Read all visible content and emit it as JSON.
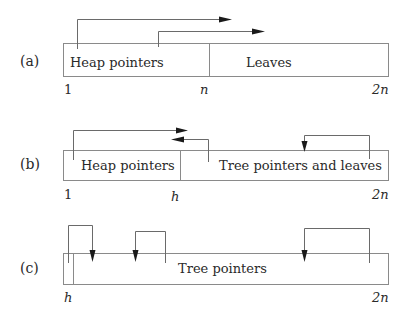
{
  "diagram": {
    "panels": [
      {
        "id": "a",
        "label": "(a)",
        "segments": [
          {
            "text": "Heap pointers"
          },
          {
            "text": "Leaves"
          }
        ],
        "ticks": [
          "1",
          "n",
          "2n"
        ],
        "arrows": [
          {
            "from": "heap pointers region",
            "to": "leaves region",
            "direction": "right"
          },
          {
            "from": "heap pointers region",
            "to": "leaves region",
            "direction": "right"
          }
        ]
      },
      {
        "id": "b",
        "label": "(b)",
        "segments": [
          {
            "text": "Heap pointers"
          },
          {
            "text": "Tree pointers and leaves"
          }
        ],
        "ticks": [
          "1",
          "h",
          "2n"
        ],
        "arrows": [
          {
            "from": "heap pointers region",
            "to": "boundary h",
            "direction": "right"
          },
          {
            "from": "tree pointers region",
            "to": "boundary h",
            "direction": "left"
          },
          {
            "from": "tree pointers region (right)",
            "to": "tree pointers region (middle)",
            "direction": "down"
          }
        ]
      },
      {
        "id": "c",
        "label": "(c)",
        "segments": [
          {
            "text": "Tree pointers"
          }
        ],
        "ticks": [
          "h",
          "2n"
        ],
        "arrows": [
          {
            "from": "cell at h",
            "to": "tree pointer",
            "direction": "down"
          },
          {
            "from": "tree pointer",
            "to": "tree pointer",
            "direction": "down"
          },
          {
            "from": "tree pointer (right)",
            "to": "tree pointer (middle)",
            "direction": "down"
          }
        ]
      }
    ]
  }
}
